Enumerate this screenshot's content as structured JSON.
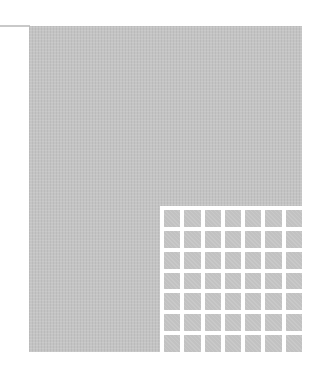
{
  "figure": {
    "panel_color": "#c4c4c4",
    "grid_line_color": "#ffffff",
    "grid": {
      "rows": 7,
      "columns": 7
    }
  }
}
